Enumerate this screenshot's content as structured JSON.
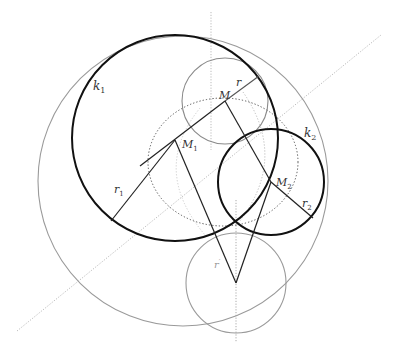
{
  "diagram": {
    "title": "",
    "colors": {
      "thick": "#111111",
      "gray": "#999999",
      "light": "#c8c8c8",
      "dotted": "#666666"
    },
    "labels": {
      "k1": {
        "main": "k",
        "sub": "1"
      },
      "k2": {
        "main": "k",
        "sub": "2"
      },
      "M": {
        "main": "M",
        "sub": ""
      },
      "M1": {
        "main": "M",
        "sub": "1"
      },
      "M2": {
        "main": "M",
        "sub": "2"
      },
      "r": {
        "main": "r",
        "sub": ""
      },
      "r1": {
        "main": "r",
        "sub": "1"
      },
      "r2": {
        "main": "r",
        "sub": "2"
      },
      "r_prime": {
        "main": "r",
        "sub": "′"
      }
    },
    "points": {
      "M": [
        225,
        101
      ],
      "M1": [
        175,
        140
      ],
      "M2": [
        271,
        182
      ],
      "apex": [
        236,
        283
      ],
      "intersection": [
        236,
        223
      ]
    },
    "circles": [
      {
        "name": "outer-circle",
        "cx": 183,
        "cy": 181,
        "r": 145,
        "style": "gray"
      },
      {
        "name": "k1",
        "cx": 175,
        "cy": 138,
        "r": 103,
        "style": "thick"
      },
      {
        "name": "k2",
        "cx": 271,
        "cy": 182,
        "r": 53,
        "style": "thick"
      },
      {
        "name": "circle-M",
        "cx": 225,
        "cy": 101,
        "r": 44,
        "style": "gray"
      },
      {
        "name": "circle-r-prime",
        "cx": 236,
        "cy": 283,
        "r": 50,
        "style": "gray"
      }
    ],
    "ellipse": {
      "cx": 223,
      "cy": 162,
      "rx": 75,
      "ry": 64,
      "style": "dotted"
    }
  }
}
